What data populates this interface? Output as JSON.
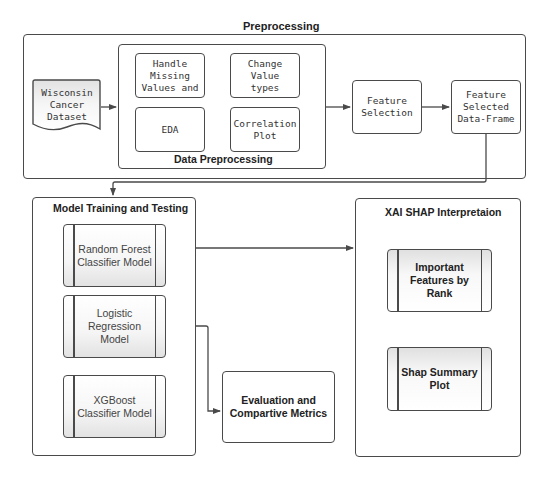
{
  "preprocessing": {
    "title": "Preprocessing",
    "dataset": "Wisconsin\nCancer\nDataset",
    "data_preprocessing": {
      "title": "Data Preprocessing",
      "steps": [
        "Handle\nMissing\nValues and",
        "Change\nValue\ntypes",
        "EDA",
        "Correlation\nPlot"
      ]
    },
    "feature_selection": "Feature\nSelection",
    "feature_selected_df": "Feature\nSelected\nData-Frame"
  },
  "model_training": {
    "title": "Model Training and Testing",
    "models": [
      "Random Forest\nClassifier Model",
      "Logistic\nRegression\nModel",
      "XGBoost\nClassifier Model"
    ]
  },
  "evaluation": "Evaluation and\nCompartive Metrics",
  "xai": {
    "title": "XAI SHAP Interpretaion",
    "items": [
      "Important\nFeatures by\nRank",
      "Shap Summary\nPlot"
    ]
  },
  "colors": {
    "stroke": "#4a4a4a",
    "background": "#ffffff",
    "process_gradient": "#e2e2e2"
  }
}
